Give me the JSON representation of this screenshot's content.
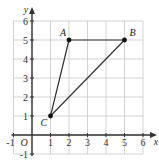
{
  "diagram": {
    "type": "coordinate-grid-triangle",
    "axes": {
      "x_label": "x",
      "y_label": "y",
      "origin_label": "O",
      "x_ticks": [
        "-1",
        "1",
        "2",
        "3",
        "4",
        "5",
        "6"
      ],
      "y_ticks": [
        "-1",
        "1",
        "2",
        "3",
        "4",
        "5",
        "6"
      ],
      "x_range": [
        -1,
        6
      ],
      "y_range": [
        -1,
        6
      ]
    },
    "points": [
      {
        "label": "A",
        "x": 2,
        "y": 5
      },
      {
        "label": "B",
        "x": 5,
        "y": 5
      },
      {
        "label": "C",
        "x": 1,
        "y": 1
      }
    ],
    "segments": [
      {
        "from": "A",
        "to": "B"
      },
      {
        "from": "B",
        "to": "C"
      },
      {
        "from": "C",
        "to": "A"
      }
    ],
    "colors": {
      "grid": "#c8c8c8",
      "axis": "#333333",
      "lines": "#333333",
      "points": "#111111"
    }
  }
}
